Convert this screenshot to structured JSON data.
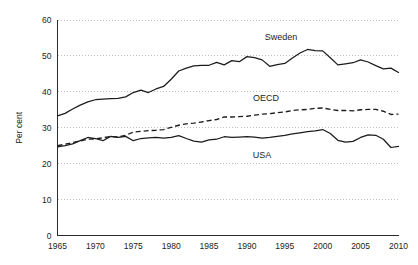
{
  "chart_data": {
    "type": "line",
    "title": "",
    "subtitle": "",
    "xlabel": "",
    "ylabel": "Per cent",
    "xlim": [
      1965,
      2010
    ],
    "ylim": [
      0,
      60
    ],
    "grid": true,
    "legend_position": "inline-labels",
    "xticks": [
      "1965",
      "1970",
      "1975",
      "1980",
      "1985",
      "1990",
      "1995",
      "2000",
      "2005",
      "2010"
    ],
    "xtick_values": [
      1965,
      1970,
      1975,
      1980,
      1985,
      1990,
      1995,
      2000,
      2005,
      2010
    ],
    "yticks": [
      "0",
      "10",
      "20",
      "30",
      "40",
      "50",
      "60"
    ],
    "ytick_values": [
      0,
      10,
      20,
      30,
      40,
      50,
      60
    ],
    "x": [
      1965,
      1966,
      1967,
      1968,
      1969,
      1970,
      1971,
      1972,
      1973,
      1974,
      1975,
      1976,
      1977,
      1978,
      1979,
      1980,
      1981,
      1982,
      1983,
      1984,
      1985,
      1986,
      1987,
      1988,
      1989,
      1990,
      1991,
      1992,
      1993,
      1994,
      1995,
      1996,
      1997,
      1998,
      1999,
      2000,
      2001,
      2002,
      2003,
      2004,
      2005,
      2006,
      2007,
      2008,
      2009,
      2010
    ],
    "series": [
      {
        "name": "Sweden",
        "style": "solid",
        "color": "#1c1c1c",
        "label": "Sweden",
        "label_x": 1994.5,
        "label_y": 55.2,
        "values": [
          33.3,
          34.0,
          35.2,
          36.3,
          37.2,
          37.8,
          38.0,
          38.1,
          38.2,
          38.6,
          39.8,
          40.5,
          39.8,
          40.8,
          41.5,
          43.5,
          45.8,
          46.6,
          47.2,
          47.4,
          47.4,
          48.2,
          47.5,
          48.7,
          48.4,
          49.8,
          49.5,
          48.9,
          47.1,
          47.6,
          47.9,
          49.4,
          50.8,
          51.8,
          51.5,
          51.4,
          49.5,
          47.5,
          47.8,
          48.1,
          48.9,
          48.3,
          47.3,
          46.4,
          46.6,
          45.4
        ]
      },
      {
        "name": "OECD",
        "style": "dashed",
        "color": "#1c1c1c",
        "label": "OECD",
        "label_x": 1992.5,
        "label_y": 38.2,
        "values": [
          25.0,
          25.4,
          25.9,
          26.3,
          26.8,
          26.9,
          27.2,
          27.6,
          27.4,
          27.9,
          28.8,
          29.0,
          29.2,
          29.3,
          29.5,
          30.1,
          30.7,
          31.1,
          31.3,
          31.6,
          32.0,
          32.3,
          33.0,
          33.0,
          33.1,
          33.2,
          33.5,
          33.8,
          33.9,
          34.2,
          34.4,
          34.8,
          35.0,
          35.1,
          35.4,
          35.5,
          35.1,
          34.8,
          34.8,
          34.7,
          35.0,
          35.1,
          35.1,
          34.6,
          33.7,
          33.8
        ]
      },
      {
        "name": "USA",
        "style": "solid",
        "color": "#1c1c1c",
        "label": "USA",
        "label_x": 1992.0,
        "label_y": 22.4,
        "values": [
          24.7,
          25.0,
          25.5,
          26.4,
          27.3,
          27.0,
          26.4,
          27.6,
          27.3,
          27.6,
          26.4,
          27.0,
          27.2,
          27.3,
          27.1,
          27.3,
          27.8,
          27.0,
          26.3,
          26.0,
          26.6,
          26.8,
          27.5,
          27.3,
          27.4,
          27.5,
          27.4,
          27.1,
          27.3,
          27.6,
          27.9,
          28.3,
          28.6,
          28.9,
          29.1,
          29.5,
          28.4,
          26.5,
          26.0,
          26.2,
          27.3,
          28.0,
          27.9,
          26.8,
          24.5,
          24.8
        ]
      }
    ]
  }
}
